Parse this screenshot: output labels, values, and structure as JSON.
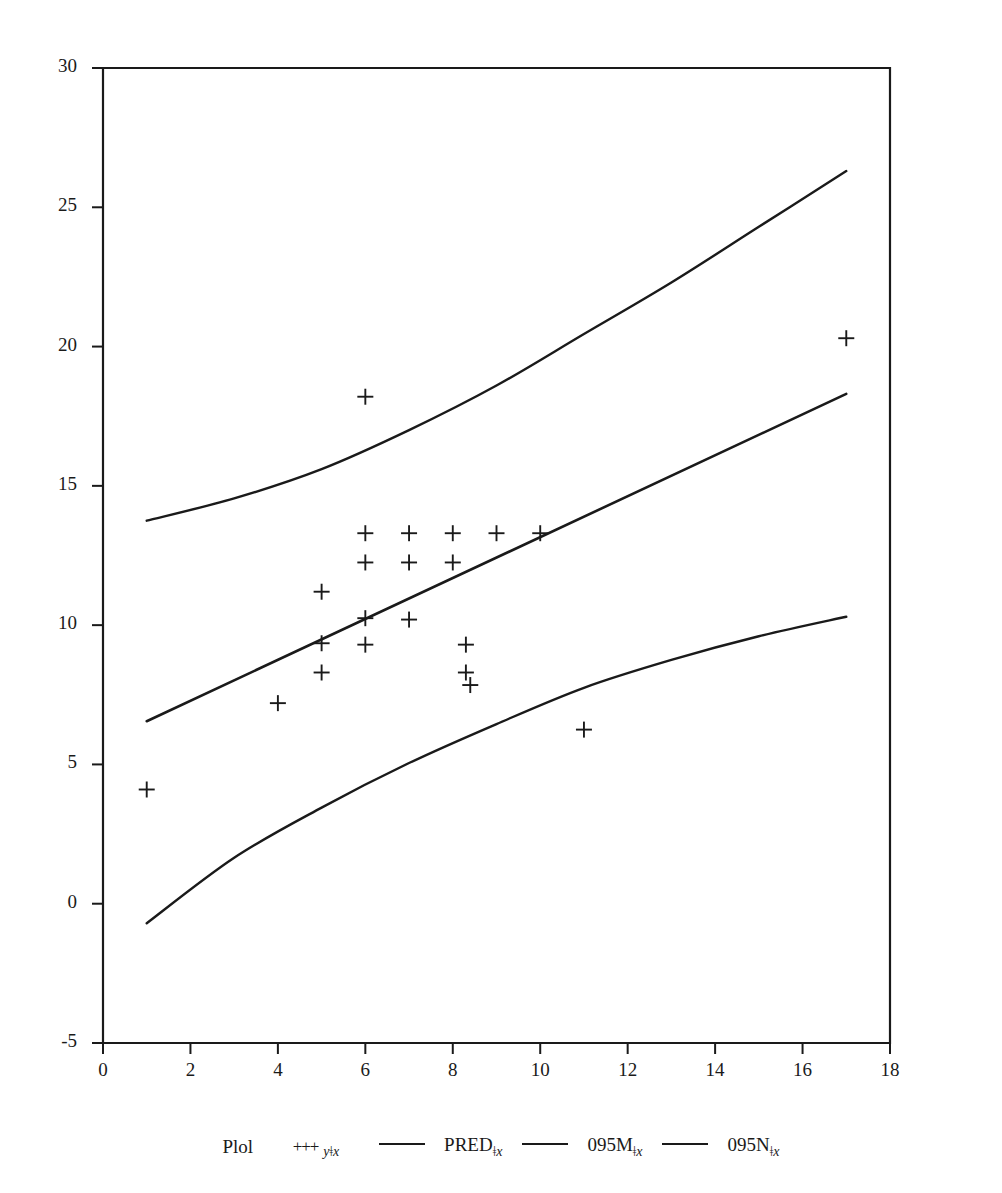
{
  "equation": {
    "lhs": "y",
    "text": "y = 5.6346 + 0.7234 x",
    "intercept": 5.6346,
    "slope": 0.7234
  },
  "stats": [
    {
      "key": "N",
      "value": "20"
    },
    {
      "key": "Rsg",
      "value": "0.3787"
    },
    {
      "key": "AdjRsg",
      "value": "0.3441"
    },
    {
      "key": "RMSE",
      "value": "3.056"
    }
  ],
  "axes": {
    "ylabel": "y",
    "xlabel": "",
    "xticks": [
      "0",
      "2",
      "4",
      "6",
      "8",
      "10",
      "12",
      "14",
      "16",
      "18"
    ],
    "yticks": [
      "30",
      "25",
      "20",
      "15",
      "10",
      "5",
      "0",
      "-5"
    ]
  },
  "legend": {
    "title": "Plol",
    "sep": "ǂ",
    "entries": [
      {
        "marker": "+++",
        "base": "y",
        "var": "x",
        "label": "y"
      },
      {
        "marker": "line",
        "base": "PRED",
        "var": "x",
        "label": "PRED"
      },
      {
        "marker": "line",
        "base": "095M",
        "var": "x",
        "label": "095M"
      },
      {
        "marker": "line",
        "base": "095N",
        "var": "x",
        "label": "095N"
      }
    ]
  },
  "chart_data": {
    "type": "scatter",
    "title": "",
    "xlabel": "",
    "ylabel": "y",
    "xlim": [
      0,
      18
    ],
    "ylim": [
      -5,
      30
    ],
    "grid": false,
    "legend_position": "bottom",
    "marker": "plus",
    "points": [
      {
        "x": 1,
        "y": 4.1
      },
      {
        "x": 4,
        "y": 7.2
      },
      {
        "x": 5,
        "y": 11.2
      },
      {
        "x": 5,
        "y": 9.35
      },
      {
        "x": 5,
        "y": 8.3
      },
      {
        "x": 6,
        "y": 18.2
      },
      {
        "x": 6,
        "y": 13.3
      },
      {
        "x": 6,
        "y": 12.25
      },
      {
        "x": 6,
        "y": 10.25
      },
      {
        "x": 6,
        "y": 9.3
      },
      {
        "x": 7,
        "y": 13.3
      },
      {
        "x": 7,
        "y": 12.25
      },
      {
        "x": 7,
        "y": 10.2
      },
      {
        "x": 8,
        "y": 13.3
      },
      {
        "x": 8,
        "y": 12.25
      },
      {
        "x": 8.3,
        "y": 9.3
      },
      {
        "x": 8.3,
        "y": 8.3
      },
      {
        "x": 8.4,
        "y": 7.85
      },
      {
        "x": 9,
        "y": 13.3
      },
      {
        "x": 10,
        "y": 13.3
      },
      {
        "x": 11,
        "y": 6.25
      },
      {
        "x": 17,
        "y": 20.3
      }
    ],
    "series": [
      {
        "name": "PRED",
        "type": "line",
        "x": [
          1,
          17
        ],
        "values": [
          6.55,
          18.3
        ]
      },
      {
        "name": "095M",
        "type": "line",
        "curve": "upper-confidence-band",
        "x": [
          1,
          3,
          5,
          7,
          9,
          11,
          13,
          15,
          17
        ],
        "values": [
          13.75,
          14.55,
          15.6,
          17.0,
          18.6,
          20.45,
          22.3,
          24.3,
          26.3
        ]
      },
      {
        "name": "095N",
        "type": "line",
        "curve": "lower-confidence-band",
        "x": [
          1,
          3,
          5,
          7,
          9,
          11,
          13,
          15,
          17
        ],
        "values": [
          -0.7,
          1.65,
          3.45,
          5.05,
          6.45,
          7.75,
          8.75,
          9.6,
          10.3
        ]
      }
    ]
  },
  "colors": {
    "ink": "#1a1a1a",
    "background": "#ffffff"
  }
}
